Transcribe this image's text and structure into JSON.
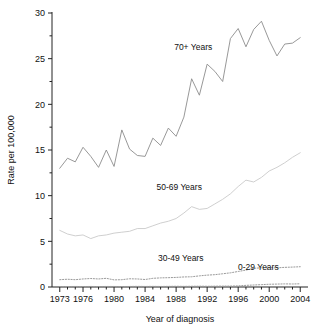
{
  "chart_data": {
    "type": "line",
    "title": "",
    "xlabel": "Year of diagnosis",
    "ylabel": "Rate per 100,000",
    "xlim": [
      1972,
      2005
    ],
    "ylim": [
      0,
      30
    ],
    "grid": false,
    "legend_position": "inline-annotations",
    "x_ticks_major": [
      1973,
      1976,
      1980,
      1984,
      1988,
      1992,
      1996,
      2000,
      2004
    ],
    "x_tick_labels": [
      "1973",
      "1976",
      "1980",
      "1984",
      "1988",
      "1992",
      "1996",
      "2000",
      "2004"
    ],
    "y_ticks_major": [
      0,
      5,
      10,
      15,
      20,
      25,
      30
    ],
    "y_tick_labels": [
      "0",
      "5",
      "10",
      "15",
      "20",
      "25",
      "30"
    ],
    "y_ticks_minor": [
      2.5,
      7.5,
      12.5,
      17.5,
      22.5,
      27.5
    ],
    "x": [
      1973,
      1974,
      1975,
      1976,
      1977,
      1978,
      1979,
      1980,
      1981,
      1982,
      1983,
      1984,
      1985,
      1986,
      1987,
      1988,
      1989,
      1990,
      1991,
      1992,
      1993,
      1994,
      1995,
      1996,
      1997,
      1998,
      1999,
      2000,
      2001,
      2002,
      2003,
      2004
    ],
    "series": [
      {
        "name": "70+ Years",
        "label": "70+ Years",
        "color": "#8c8c8c",
        "style": "solid",
        "label_x": 1990.2,
        "label_y": 25.9,
        "values": [
          13.0,
          14.1,
          13.7,
          15.3,
          14.3,
          13.1,
          15.0,
          13.2,
          17.2,
          15.1,
          14.4,
          14.3,
          16.3,
          15.5,
          17.4,
          16.5,
          18.6,
          22.8,
          21.0,
          24.4,
          23.6,
          22.5,
          27.2,
          28.3,
          26.3,
          28.2,
          29.1,
          27.0,
          25.3,
          26.6,
          26.7,
          27.3
        ]
      },
      {
        "name": "50-69 Years",
        "label": "50-69 Years",
        "color": "#c9c9c9",
        "style": "solid",
        "label_x": 1988.4,
        "label_y": 10.6,
        "values": [
          6.2,
          5.8,
          5.6,
          5.7,
          5.3,
          5.6,
          5.7,
          5.9,
          6.0,
          6.1,
          6.4,
          6.4,
          6.7,
          7.0,
          7.2,
          7.5,
          8.1,
          8.8,
          8.5,
          8.6,
          9.1,
          9.6,
          10.2,
          11.0,
          11.7,
          11.5,
          12.0,
          12.7,
          13.1,
          13.6,
          14.2,
          14.7
        ]
      },
      {
        "name": "30-49 Years",
        "label": "30-49 Years",
        "color": "#9a9a9a",
        "style": "dotted",
        "label_x": 1988.6,
        "label_y": 2.85,
        "values": [
          0.8,
          0.85,
          0.8,
          0.88,
          0.93,
          0.88,
          0.95,
          0.78,
          0.8,
          0.9,
          0.88,
          0.82,
          0.95,
          1.0,
          1.02,
          1.05,
          1.1,
          1.12,
          1.22,
          1.3,
          1.35,
          1.45,
          1.55,
          1.7,
          1.85,
          2.05,
          2.1,
          2.12,
          2.1,
          2.15,
          2.18,
          2.22
        ]
      },
      {
        "name": "0-29 Years",
        "label": "0-29 Years",
        "color": "#9a9a9a",
        "style": "dotted",
        "label_x": 1998.6,
        "label_y": 1.85,
        "values": [
          0.05,
          0.05,
          0.06,
          0.05,
          0.06,
          0.05,
          0.06,
          0.06,
          0.05,
          0.06,
          0.07,
          0.06,
          0.07,
          0.06,
          0.07,
          0.08,
          0.07,
          0.08,
          0.09,
          0.08,
          0.09,
          0.1,
          0.1,
          0.12,
          0.18,
          0.22,
          0.26,
          0.3,
          0.32,
          0.34,
          0.33,
          0.35
        ]
      }
    ]
  }
}
